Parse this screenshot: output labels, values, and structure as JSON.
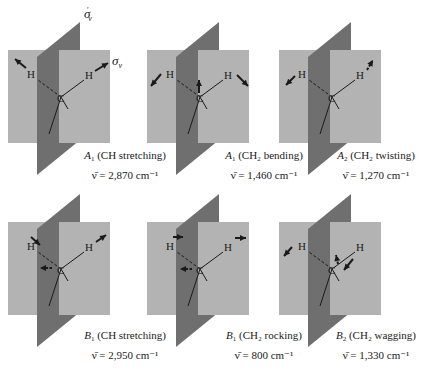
{
  "figure": {
    "colors": {
      "mirror_plane_front": "#b3b3b3",
      "mirror_plane_back": "#6f6f6f",
      "ink": "#1a1a1a",
      "background": "#ffffff"
    },
    "plane_labels": {
      "sigma_v_prime": {
        "symbol": "σ",
        "subscript": "v",
        "prime": "′"
      },
      "sigma_v": {
        "symbol": "σ",
        "subscript": "v"
      }
    },
    "atoms": {
      "carbon": "C",
      "hydrogen": "H"
    },
    "modes": [
      {
        "symmetry": "A",
        "symmetry_sub": "1",
        "description": "(CH stretching)",
        "wavenumber_label": "ν̄ = 2,870 cm⁻¹",
        "wavenumber": 2870,
        "unit": "cm⁻¹",
        "motion": "sym-stretch"
      },
      {
        "symmetry": "A",
        "symmetry_sub": "1",
        "description": "(CH₂ bending)",
        "wavenumber_label": "ν̄ = 1,460 cm⁻¹",
        "wavenumber": 1460,
        "unit": "cm⁻¹",
        "motion": "bend"
      },
      {
        "symmetry": "A",
        "symmetry_sub": "2",
        "description": "(CH₂ twisting)",
        "wavenumber_label": "ν̄ = 1,270 cm⁻¹",
        "wavenumber": 1270,
        "unit": "cm⁻¹",
        "motion": "twist"
      },
      {
        "symmetry": "B",
        "symmetry_sub": "1",
        "description": "(CH stretching)",
        "wavenumber_label": "ν̄ = 2,950 cm⁻¹",
        "wavenumber": 2950,
        "unit": "cm⁻¹",
        "motion": "asym-stretch"
      },
      {
        "symmetry": "B",
        "symmetry_sub": "1",
        "description": "(CH₂ rocking)",
        "wavenumber_label": "ν̄ = 800 cm⁻¹",
        "wavenumber": 800,
        "unit": "cm⁻¹",
        "motion": "rock"
      },
      {
        "symmetry": "B",
        "symmetry_sub": "2",
        "description": "(CH₂ wagging)",
        "wavenumber_label": "ν̄ = 1,330 cm⁻¹",
        "wavenumber": 1330,
        "unit": "cm⁻¹",
        "motion": "wag"
      }
    ]
  }
}
